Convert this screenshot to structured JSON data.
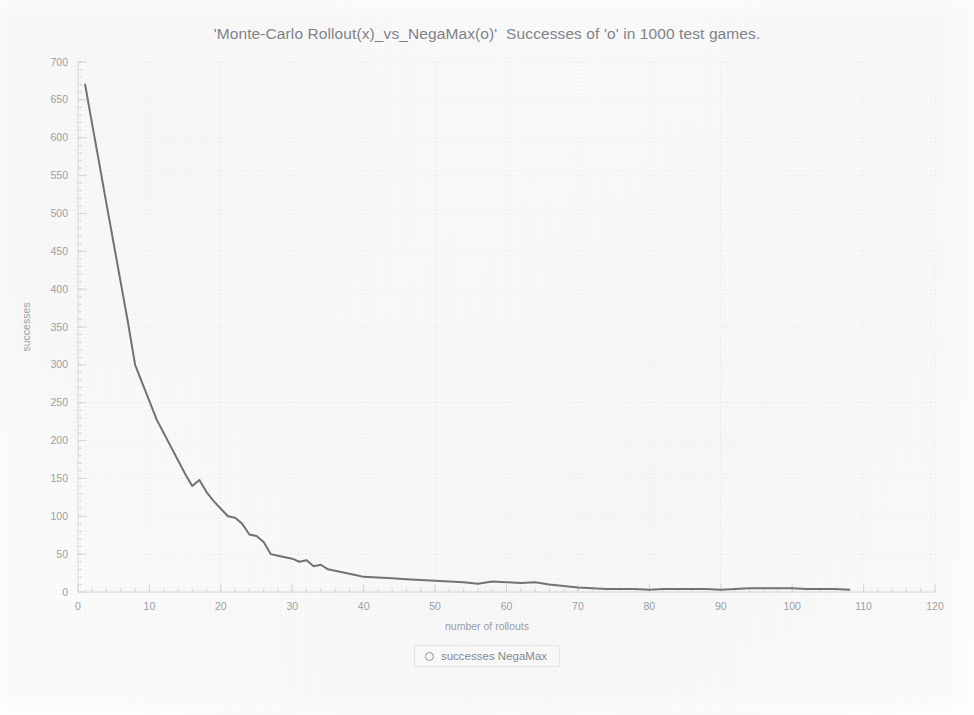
{
  "chart_data": {
    "type": "line",
    "title": "'Monte-Carlo Rollout(x)_vs_NegaMax(o)'  Successes of 'o' in 1000 test games.",
    "xlabel": "number of rollouts",
    "ylabel": "successes",
    "xlim": [
      0,
      120
    ],
    "ylim": [
      0,
      700
    ],
    "xticks": [
      0,
      10,
      20,
      30,
      40,
      50,
      60,
      70,
      80,
      90,
      100,
      110,
      120
    ],
    "yticks": [
      0,
      50,
      100,
      150,
      200,
      250,
      300,
      350,
      400,
      450,
      500,
      550,
      600,
      650,
      700
    ],
    "x_minor_tick_step": 2,
    "y_minor_tick_step": 10,
    "grid": true,
    "grid_style": "dotted",
    "legend_position": "bottom-center",
    "legend": [
      {
        "label": "successes NegaMax",
        "marker": "circle-open",
        "color": "#6e7176"
      }
    ],
    "series": [
      {
        "name": "successes NegaMax",
        "color": "#6e7176",
        "x": [
          1,
          2,
          3,
          4,
          5,
          6,
          7,
          8,
          9,
          10,
          11,
          12,
          13,
          14,
          15,
          16,
          17,
          18,
          19,
          20,
          21,
          22,
          23,
          24,
          25,
          26,
          27,
          28,
          29,
          30,
          31,
          32,
          33,
          34,
          35,
          36,
          37,
          38,
          39,
          40,
          42,
          44,
          46,
          48,
          50,
          52,
          54,
          56,
          58,
          60,
          62,
          64,
          66,
          68,
          70,
          72,
          74,
          76,
          78,
          80,
          82,
          84,
          86,
          88,
          90,
          92,
          94,
          96,
          98,
          100,
          102,
          104,
          106,
          108
        ],
        "y": [
          670,
          617,
          565,
          512,
          460,
          408,
          356,
          300,
          276,
          252,
          228,
          210,
          192,
          174,
          156,
          140,
          148,
          132,
          120,
          110,
          100,
          98,
          90,
          76,
          74,
          66,
          50,
          48,
          46,
          44,
          40,
          42,
          34,
          36,
          30,
          28,
          26,
          24,
          22,
          20,
          19,
          18,
          17,
          16,
          15,
          14,
          13,
          11,
          14,
          13,
          12,
          13,
          10,
          8,
          6,
          5,
          4,
          4,
          4,
          3,
          4,
          4,
          4,
          4,
          3,
          4,
          5,
          5,
          5,
          5,
          4,
          4,
          4,
          3
        ]
      }
    ]
  },
  "legend": {
    "entry_label": "successes NegaMax"
  },
  "axes": {
    "x_title": "number of rollouts",
    "y_title": "successes"
  },
  "colors": {
    "line": "#6e7176",
    "tick_label": "#9b9ea4",
    "title": "#7f8288",
    "grid": "#e9eaee",
    "axis": "#d6d8dc",
    "background": "#fbfbfb"
  }
}
